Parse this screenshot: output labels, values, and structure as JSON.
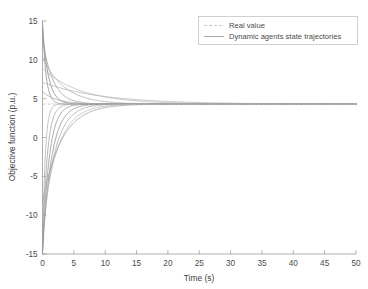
{
  "chart_data": {
    "type": "line",
    "title": "",
    "xlabel": "Time (s)",
    "ylabel": "Objective function (p.u.)",
    "xlim": [
      0,
      50
    ],
    "ylim": [
      -15,
      15
    ],
    "xticks": [
      0,
      5,
      10,
      15,
      20,
      25,
      30,
      35,
      40,
      45,
      50
    ],
    "yticks": [
      -15,
      -10,
      -5,
      0,
      5,
      10,
      15
    ],
    "grid": false,
    "legend_position": "upper right",
    "legend": [
      {
        "label": "Real value",
        "style": "dashed",
        "color": "#b9b9b9"
      },
      {
        "label": "Dynamic agents state trajectories",
        "style": "solid",
        "color": "#9e9e9e"
      }
    ],
    "consensus_value": 4.3,
    "real_value_series": {
      "name": "Real value",
      "x": [
        0,
        50
      ],
      "y": [
        4.3,
        4.3
      ],
      "color": "#c3c3c3",
      "dash": "3,2"
    },
    "series": [
      {
        "name": "agent-1",
        "color": "#8e8e8e",
        "y0": 15.0,
        "tau": 0.55
      },
      {
        "name": "agent-2",
        "color": "#868686",
        "y0": 14.2,
        "tau": 0.95
      },
      {
        "name": "agent-3",
        "color": "#9b9b9b",
        "y0": 12.6,
        "tau": 1.7
      },
      {
        "name": "agent-4",
        "color": "#a8a8a8",
        "y0": 10.4,
        "tau": 3.4
      },
      {
        "name": "agent-5",
        "color": "#b4b4b4",
        "y0": 8.9,
        "tau": 6.2
      },
      {
        "name": "agent-6",
        "color": "#adadad",
        "y0": 7.1,
        "tau": 9.5
      },
      {
        "name": "agent-7",
        "color": "#9f9f9f",
        "y0": 5.9,
        "tau": 2.3
      },
      {
        "name": "agent-8",
        "color": "#b0b0b0",
        "y0": -15.0,
        "tau": 0.42
      },
      {
        "name": "agent-9",
        "color": "#a2a2a2",
        "y0": -15.0,
        "tau": 0.72
      },
      {
        "name": "agent-10",
        "color": "#939393",
        "y0": -15.0,
        "tau": 1.05
      },
      {
        "name": "agent-11",
        "color": "#8b8b8b",
        "y0": -14.6,
        "tau": 1.45
      },
      {
        "name": "agent-12",
        "color": "#a5a5a5",
        "y0": -13.2,
        "tau": 1.9
      },
      {
        "name": "agent-13",
        "color": "#b6b6b6",
        "y0": -11.0,
        "tau": 2.45
      },
      {
        "name": "agent-14",
        "color": "#9c9c9c",
        "y0": -8.4,
        "tau": 3.0
      }
    ]
  }
}
